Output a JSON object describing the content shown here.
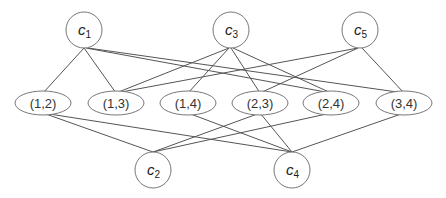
{
  "diagram": {
    "type": "bipartite-graph",
    "colors": {
      "stroke": "#777777",
      "edge": "#555555",
      "text": "#222222",
      "background": "#ffffff"
    },
    "top_nodes": [
      {
        "id": "c1",
        "letter": "c",
        "sub": "1",
        "x": 84,
        "y": 30
      },
      {
        "id": "c3",
        "letter": "c",
        "sub": "3",
        "x": 231,
        "y": 30
      },
      {
        "id": "c5",
        "letter": "c",
        "sub": "5",
        "x": 360,
        "y": 30
      }
    ],
    "pair_nodes": [
      {
        "id": "p12",
        "label": "(1,2)",
        "x": 43,
        "y": 103
      },
      {
        "id": "p13",
        "label": "(1,3)",
        "x": 116,
        "y": 103
      },
      {
        "id": "p14",
        "label": "(1,4)",
        "x": 188,
        "y": 103
      },
      {
        "id": "p23",
        "label": "(2,3)",
        "x": 260,
        "y": 103
      },
      {
        "id": "p24",
        "label": "(2,4)",
        "x": 331,
        "y": 103
      },
      {
        "id": "p34",
        "label": "(3,4)",
        "x": 404,
        "y": 103
      }
    ],
    "bottom_nodes": [
      {
        "id": "c2",
        "letter": "c",
        "sub": "2",
        "x": 153,
        "y": 170
      },
      {
        "id": "c4",
        "letter": "c",
        "sub": "4",
        "x": 292,
        "y": 170
      }
    ],
    "edges": [
      [
        "c1",
        "p12"
      ],
      [
        "c1",
        "p13"
      ],
      [
        "c1",
        "p14"
      ],
      [
        "c3",
        "p13"
      ],
      [
        "c3",
        "p23"
      ],
      [
        "c3",
        "p34"
      ],
      [
        "c5",
        "p13"
      ],
      [
        "c5",
        "p24"
      ],
      [
        "c5",
        "p34"
      ],
      [
        "p12",
        "c2"
      ],
      [
        "p23",
        "c2"
      ],
      [
        "p24",
        "c2"
      ],
      [
        "p12",
        "c4"
      ],
      [
        "p14",
        "c4"
      ],
      [
        "p24",
        "c4"
      ],
      [
        "p34",
        "c4"
      ]
    ]
  }
}
